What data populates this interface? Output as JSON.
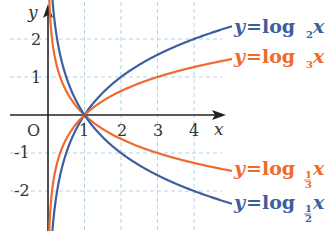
{
  "chart_data": {
    "type": "line",
    "title": "",
    "xlabel": "x",
    "ylabel": "y",
    "origin_label": "O",
    "x_ticks": [
      "1",
      "2",
      "3",
      "4"
    ],
    "y_ticks": [
      "2",
      "1",
      "-1",
      "-2"
    ],
    "xlim": [
      -1,
      4.9
    ],
    "ylim": [
      -3,
      2.9
    ],
    "grid": true,
    "legend_position": "right, next to curve ends",
    "series": [
      {
        "name": "y=log₂x",
        "base": 2,
        "color": "#3c5fa0",
        "points": [
          [
            0.125,
            -3
          ],
          [
            0.25,
            -2
          ],
          [
            0.5,
            -1
          ],
          [
            1,
            0
          ],
          [
            2,
            1
          ],
          [
            4,
            2
          ],
          [
            5.1,
            2.35
          ]
        ]
      },
      {
        "name": "y=log₃x",
        "base": 3,
        "color": "#ee6a2e",
        "points": [
          [
            0.037,
            -3
          ],
          [
            0.111,
            -2
          ],
          [
            0.333,
            -1
          ],
          [
            1,
            0
          ],
          [
            3,
            1
          ],
          [
            5.1,
            1.48
          ]
        ]
      },
      {
        "name": "y=log₁/₃x",
        "base": 0.3333,
        "color": "#ee6a2e",
        "points": [
          [
            0.037,
            3
          ],
          [
            0.111,
            2
          ],
          [
            0.333,
            1
          ],
          [
            1,
            0
          ],
          [
            3,
            -1
          ],
          [
            5.1,
            -1.48
          ]
        ]
      },
      {
        "name": "y=log₁/₂x",
        "base": 0.5,
        "color": "#3c5fa0",
        "points": [
          [
            0.125,
            3
          ],
          [
            0.25,
            2
          ],
          [
            0.5,
            1
          ],
          [
            1,
            0
          ],
          [
            2,
            -1
          ],
          [
            4,
            -2
          ],
          [
            5.1,
            -2.35
          ]
        ]
      }
    ]
  },
  "legend": {
    "log2": {
      "y": "y",
      "eq": "=log",
      "sub": "2",
      "x": "x"
    },
    "log3": {
      "y": "y",
      "eq": "=log",
      "sub": "3",
      "x": "x"
    },
    "log13": {
      "y": "y",
      "eq": "=log",
      "num": "1",
      "den": "3",
      "x": "x"
    },
    "log12": {
      "y": "y",
      "eq": "=log",
      "num": "1",
      "den": "2",
      "x": "x"
    }
  },
  "colors": {
    "blue": "#3c5fa0",
    "orange": "#ee6a2e",
    "grid": "#a9cde6",
    "axis": "#222222"
  }
}
